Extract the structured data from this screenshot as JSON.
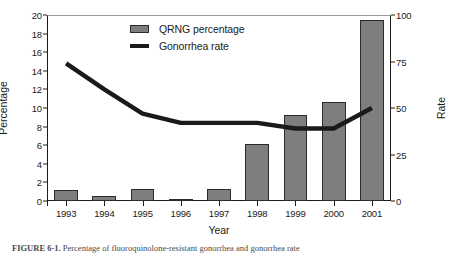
{
  "axes": {
    "xlabel": "Year",
    "ylabel_left": "Percentage",
    "ylabel_right": "Rate"
  },
  "legend": {
    "items": [
      {
        "label": "QRNG percentage",
        "marker": "bar-swatch",
        "color": "#7e7e7e"
      },
      {
        "label": "Gonorrhea rate",
        "marker": "line-swatch",
        "color": "#1a1a1a"
      }
    ]
  },
  "caption": {
    "label": "FIGURE 6-1.",
    "text": "Percentage of fluoroquinolone-resistant gonorrhea and gonorrhea rate"
  },
  "chart_data": {
    "type": "bar",
    "title": "",
    "xlabel": "Year",
    "ylabel": "Percentage",
    "ylabel_secondary": "Rate",
    "categories": [
      "1993",
      "1994",
      "1995",
      "1996",
      "1997",
      "1998",
      "1999",
      "2000",
      "2001"
    ],
    "ylim": [
      0,
      20
    ],
    "yticks": [
      0,
      2,
      4,
      6,
      8,
      10,
      12,
      14,
      16,
      18,
      20
    ],
    "ylim_secondary": [
      0,
      100
    ],
    "yticks_secondary": [
      0,
      25,
      50,
      75,
      100
    ],
    "grid": false,
    "legend_position": "upper-left-inside",
    "series": [
      {
        "name": "QRNG percentage",
        "type": "bar",
        "axis": "left",
        "color": "#7e7e7e",
        "values": [
          1.2,
          0.5,
          1.3,
          0.2,
          1.3,
          6.1,
          9.3,
          10.7,
          19.5
        ]
      },
      {
        "name": "Gonorrhea rate",
        "type": "line",
        "axis": "right",
        "color": "#1a1a1a",
        "values": [
          74,
          60,
          47,
          42,
          42,
          42,
          39,
          39,
          50
        ]
      }
    ]
  }
}
